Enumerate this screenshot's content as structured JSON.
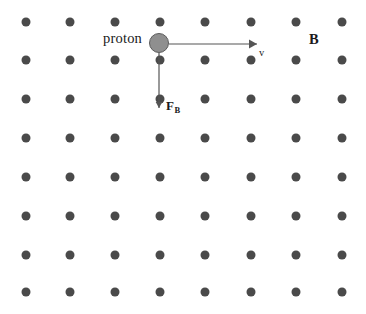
{
  "figure": {
    "kind": "physics-diagram",
    "width": 366,
    "height": 314,
    "background_color": "#ffffff"
  },
  "field": {
    "icon": "field-out-of-page-dot-grid",
    "dot_color": "#4a4a4a",
    "dot_diameter": 9,
    "columns": 8,
    "rows": 8,
    "column_x": [
      26,
      70,
      115,
      160,
      205,
      251,
      296,
      342
    ],
    "row_y": [
      22,
      60,
      99,
      138,
      177,
      216,
      255,
      292
    ],
    "label": "B",
    "label_x": 309,
    "label_y": 32
  },
  "particle": {
    "label": "proton",
    "label_x": 103,
    "label_y": 31,
    "center_x": 159,
    "center_y": 43,
    "radius": 9.5,
    "fill_color": "#8f8f8f",
    "stroke_color": "#5c5c5c"
  },
  "velocity_vector": {
    "label": "v",
    "label_x": 259,
    "label_y": 48,
    "from_x": 169,
    "from_y": 44,
    "to_x": 257,
    "to_y": 44,
    "color": "#555555",
    "direction": "right"
  },
  "force_vector": {
    "label": "F",
    "subscript": "B",
    "label_x": 166,
    "label_y": 99,
    "from_x": 159,
    "from_y": 53,
    "to_x": 159,
    "to_y": 108,
    "color": "#555555",
    "direction": "down"
  }
}
